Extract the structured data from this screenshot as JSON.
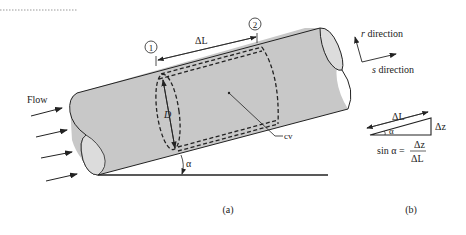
{
  "figure": {
    "panel_a": {
      "caption": "(a)",
      "flow_label": "Flow",
      "section_1": "1",
      "section_2": "2",
      "length_label": "ΔL",
      "diameter_label": "D",
      "cv_label": "cv",
      "angle_label": "α",
      "r_direction": "direction",
      "r_symbol": "r",
      "s_direction": "direction",
      "s_symbol": "s"
    },
    "panel_b": {
      "caption": "(b)",
      "hypotenuse_label": "ΔL",
      "height_label": "Δz",
      "angle_label": "α",
      "formula_lhs": "sin α =",
      "formula_num": "Δz",
      "formula_den": "ΔL"
    }
  },
  "colors": {
    "pipe_fill": "#c8c8c8",
    "pipe_end_fill": "#dcdcdc",
    "stroke": "#222222"
  }
}
